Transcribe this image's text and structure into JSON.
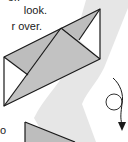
{
  "page": {
    "type": "origami-instructions"
  },
  "instructions": {
    "lines": [
      "er.",
      "look.",
      "r over.",
      "o"
    ]
  },
  "diagram": {
    "fold_model": "folded-rectangle-with-diagonal-flaps",
    "symbols": [
      {
        "name": "turn-over-symbol",
        "meaning": "turn over"
      }
    ]
  },
  "colors": {
    "paper_shaded": "#bdbdbd",
    "paper_white": "#ffffff",
    "outline": "#1a1a1a",
    "background_band": "#e6e6e6"
  }
}
